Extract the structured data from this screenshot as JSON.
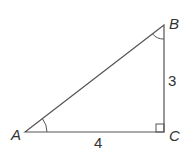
{
  "diagram": {
    "type": "right-triangle",
    "vertices": {
      "A": {
        "label": "A"
      },
      "B": {
        "label": "B"
      },
      "C": {
        "label": "C"
      }
    },
    "sides": {
      "BC": "3",
      "AC": "4"
    },
    "right_angle_at": "C",
    "marked_angles": [
      "A",
      "B"
    ],
    "colors": {
      "stroke": "#555555",
      "text": "#333333"
    }
  }
}
